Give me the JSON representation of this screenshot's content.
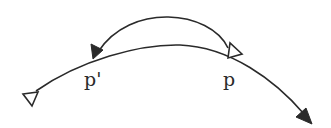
{
  "diagram": {
    "labels": {
      "p_prime": "p'",
      "p": "p"
    },
    "colors": {
      "stroke": "#2a2a2a",
      "background": "#ffffff"
    },
    "elements": [
      {
        "name": "main-curve",
        "description": "Curved trajectory from open-triangle tail (left) through p' and p to filled arrowhead (bottom right)"
      },
      {
        "name": "return-arc",
        "description": "Arc from open triangle at p back over the top to filled arrowhead at p'"
      }
    ]
  }
}
